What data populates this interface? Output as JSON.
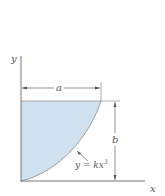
{
  "diagram": {
    "axes": {
      "x_label": "x",
      "y_label": "y"
    },
    "dimensions": {
      "width_label": "a",
      "height_label": "b"
    },
    "curve": {
      "equation_lhs": "y = kx",
      "equation_exp": "3"
    },
    "colors": {
      "fill": "#cfe0ee",
      "stroke": "#7a7a7a",
      "text": "#555555"
    }
  }
}
